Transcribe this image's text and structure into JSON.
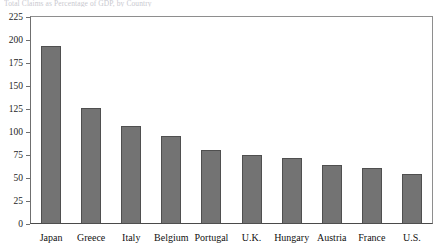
{
  "caption": {
    "text": "Total Claims as Percentage of GDP, by Country"
  },
  "chart_data": {
    "type": "bar",
    "title": "",
    "xlabel": "",
    "ylabel": "",
    "categories": [
      "Japan",
      "Greece",
      "Italy",
      "Belgium",
      "Portugal",
      "U.K.",
      "Hungary",
      "Austria",
      "France",
      "U.S."
    ],
    "values": [
      194,
      126,
      106,
      96,
      80,
      75,
      72,
      64,
      61,
      54
    ],
    "ylim": [
      0,
      225
    ],
    "yticks": [
      0,
      25,
      50,
      75,
      100,
      125,
      150,
      175,
      200,
      225
    ],
    "ytick_labels": [
      "0",
      "25",
      "50",
      "75",
      "100",
      "125",
      "150",
      "175",
      "200",
      "225"
    ],
    "grid": false,
    "legend": null,
    "bar_color": "#737373",
    "bar_edge_color": "#4f4f4f",
    "frame_color": "#6f6f6f",
    "background": "#ffffff"
  }
}
